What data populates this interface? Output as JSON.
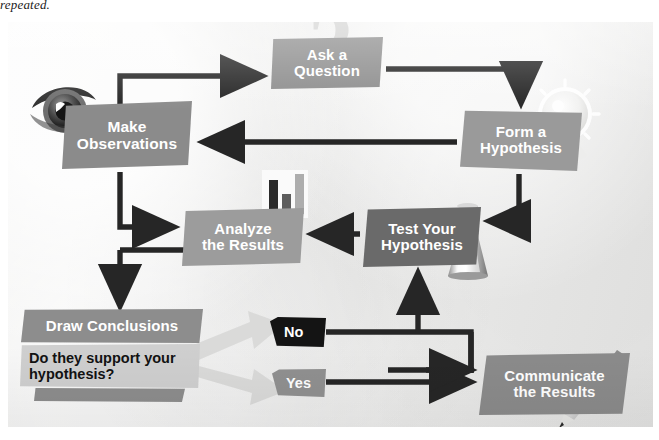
{
  "caption": "repeated.",
  "diagram": {
    "background_color": "#ececeb",
    "nodes": [
      {
        "id": "ask",
        "label_lines": [
          "Ask a",
          "Question"
        ],
        "color": "#8d8d8d",
        "text_color": "#ffffff"
      },
      {
        "id": "make",
        "label_lines": [
          "Make",
          "Observations"
        ],
        "color": "#8b8b8b",
        "text_color": "#ffffff"
      },
      {
        "id": "form",
        "label_lines": [
          "Form a",
          "Hypothesis"
        ],
        "color": "#9a9a9a",
        "text_color": "#ffffff"
      },
      {
        "id": "analyze",
        "label_lines": [
          "Analyze",
          "the Results"
        ],
        "color": "#9c9c9c",
        "text_color": "#ffffff"
      },
      {
        "id": "test",
        "label_lines": [
          "Test Your",
          "Hypothesis"
        ],
        "color": "#6a6a6a",
        "text_color": "#ffffff"
      },
      {
        "id": "draw",
        "label_lines": [
          "Draw Conclusions"
        ],
        "color": "#8d8d8d",
        "text_color": "#ffffff"
      },
      {
        "id": "comm",
        "label_lines": [
          "Communicate",
          "the Results"
        ],
        "color": "#8b8b8b",
        "text_color": "#ffffff"
      }
    ],
    "question_panel": {
      "line1": "Do they support",
      "line2": "your hypothesis?",
      "color": "#cfcfcf",
      "text_color": "#121212"
    },
    "decision_tags": [
      {
        "id": "no",
        "label": "No",
        "color": "#141414",
        "text_color": "#ffffff"
      },
      {
        "id": "yes",
        "label": "Yes",
        "color": "#909090",
        "text_color": "#ffffff"
      }
    ],
    "icons": [
      {
        "id": "eye-icon",
        "name": "eye"
      },
      {
        "id": "question-mark",
        "name": "question-mark",
        "glyph": "?"
      },
      {
        "id": "lightbulb-icon",
        "name": "lightbulb"
      },
      {
        "id": "flask-icon",
        "name": "erlenmeyer-flask"
      },
      {
        "id": "pencil-icon",
        "name": "pencil"
      },
      {
        "id": "bar-chart-icon",
        "name": "bar-chart"
      }
    ],
    "arrow_color": "#262626",
    "edges": [
      {
        "from": "make",
        "to": "ask"
      },
      {
        "from": "ask",
        "to": "form"
      },
      {
        "from": "form",
        "to": "make"
      },
      {
        "from": "form",
        "to": "test"
      },
      {
        "from": "test",
        "to": "analyze"
      },
      {
        "from": "make",
        "to": "analyze"
      },
      {
        "from": "analyze",
        "to": "make"
      },
      {
        "from": "make",
        "to": "draw"
      },
      {
        "from": "draw",
        "to": "no"
      },
      {
        "from": "draw",
        "to": "yes"
      },
      {
        "from": "no",
        "to": "test"
      },
      {
        "from": "no",
        "to": "comm"
      },
      {
        "from": "yes",
        "to": "comm"
      }
    ]
  }
}
